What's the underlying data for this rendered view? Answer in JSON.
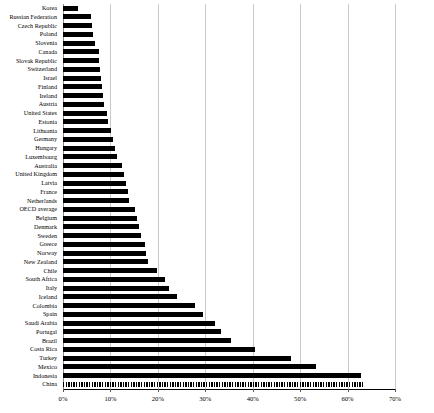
{
  "chart": {
    "type": "bar",
    "orientation": "horizontal",
    "accent_color": "#000000",
    "grid_color": "#c9c9c9"
  },
  "chart_data": {
    "type": "bar",
    "title": "",
    "xlabel": "",
    "ylabel": "",
    "orientation": "horizontal",
    "grid": true,
    "legend": "none",
    "xlim": [
      0,
      70
    ],
    "xticks": [
      0,
      10,
      20,
      30,
      40,
      50,
      60,
      70
    ],
    "xtick_labels": [
      "0%",
      "10%",
      "20%",
      "30%",
      "40%",
      "50%",
      "60%",
      "70%"
    ],
    "categories": [
      "Korea",
      "Russian Federation",
      "Czech Republic",
      "Poland",
      "Slovenia",
      "Canada",
      "Slovak Republic",
      "Switzerland",
      "Israel",
      "Finland",
      "Ireland",
      "Austria",
      "United States",
      "Estonia",
      "Lithuania",
      "Germany",
      "Hungary",
      "Luxembourg",
      "Australia",
      "United Kingdom",
      "Latvia",
      "France",
      "Netherlands",
      "OECD average",
      "Belgium",
      "Denmark",
      "Sweden",
      "Greece",
      "Norway",
      "New Zealand",
      "Chile",
      "South Africa",
      "Italy",
      "Iceland",
      "Colombia",
      "Spain",
      "Saudi Arabia",
      "Portugal",
      "Brazil",
      "Costa Rica",
      "Turkey",
      "Mexico",
      "Indonesia",
      "China"
    ],
    "values": [
      3.2,
      6.0,
      6.2,
      6.4,
      6.8,
      7.5,
      7.6,
      7.8,
      8.0,
      8.2,
      8.4,
      8.6,
      9.2,
      9.5,
      10.2,
      10.6,
      11.0,
      11.4,
      12.4,
      12.8,
      13.2,
      13.6,
      14.0,
      15.2,
      15.6,
      16.0,
      16.4,
      17.2,
      17.6,
      18.0,
      19.8,
      21.5,
      22.4,
      24.0,
      27.8,
      29.6,
      32.0,
      33.4,
      35.4,
      40.4,
      48.0,
      53.4,
      62.8,
      63.2
    ],
    "value_unit": "percent",
    "highlight_category": "China",
    "highlight_style": "hatched"
  }
}
